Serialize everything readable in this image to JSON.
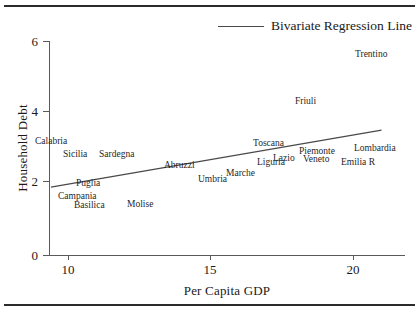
{
  "figure": {
    "background": "#ffffff",
    "text_color": "#1a1a1a",
    "rule_color": "#2b2b2b",
    "axis_color": "#5a5a5a",
    "line_color": "#4a4a4a"
  },
  "legend": {
    "label": "Bivariate Regression Line",
    "position": "top-right"
  },
  "axes": {
    "xlabel": "Per Capita GDP",
    "ylabel": "Household Debt",
    "xticks": [
      "10",
      "15",
      "20"
    ],
    "yticks": [
      "0",
      "2",
      "4",
      "6"
    ]
  },
  "chart_data": {
    "type": "scatter",
    "title": "",
    "subtitle": "",
    "xlabel": "Per Capita GDP",
    "ylabel": "Household Debt",
    "xlim": [
      9.3,
      21.7
    ],
    "ylim": [
      0,
      6.4
    ],
    "xticks": [
      10,
      15,
      20
    ],
    "yticks": [
      0,
      2,
      4,
      6
    ],
    "grid": false,
    "legend_position": "top-right",
    "point_style": "text-labels",
    "series": [
      {
        "name": "Italian Regions",
        "points": [
          {
            "label": "Trentino",
            "x": 20.6,
            "y": 5.7
          },
          {
            "label": "Friuli",
            "x": 17.3,
            "y": 4.4
          },
          {
            "label": "Calabria",
            "x": 9.6,
            "y": 3.2
          },
          {
            "label": "Sicilia",
            "x": 10.5,
            "y": 2.9
          },
          {
            "label": "Sardegna",
            "x": 12.1,
            "y": 2.9
          },
          {
            "label": "Toscana",
            "x": 17.3,
            "y": 3.1
          },
          {
            "label": "Lombardia",
            "x": 20.5,
            "y": 2.9
          },
          {
            "label": "Piemonte",
            "x": 18.7,
            "y": 2.8
          },
          {
            "label": "Lazio",
            "x": 17.9,
            "y": 2.7
          },
          {
            "label": "Veneto",
            "x": 18.9,
            "y": 2.7
          },
          {
            "label": "Emilia R",
            "x": 19.9,
            "y": 2.6
          },
          {
            "label": "Liguria",
            "x": 17.4,
            "y": 2.6
          },
          {
            "label": "Abruzzi",
            "x": 14.0,
            "y": 2.5
          },
          {
            "label": "Marche",
            "x": 15.8,
            "y": 2.4
          },
          {
            "label": "Umbria",
            "x": 15.1,
            "y": 2.3
          },
          {
            "label": "Puglia",
            "x": 10.9,
            "y": 2.0
          },
          {
            "label": "Campania",
            "x": 10.5,
            "y": 1.7
          },
          {
            "label": "Basilica",
            "x": 11.1,
            "y": 1.5
          },
          {
            "label": "Molise",
            "x": 13.0,
            "y": 1.5
          }
        ]
      }
    ],
    "regression_line": {
      "name": "Bivariate Regression Line",
      "x_start": 9.4,
      "y_start": 1.9,
      "x_end": 21.0,
      "y_end": 3.5
    }
  },
  "points": [
    {
      "label": "Trentino",
      "left": 355,
      "top": 49
    },
    {
      "label": "Friuli",
      "left": 295,
      "top": 96
    },
    {
      "label": "Calabria",
      "left": 35,
      "top": 136
    },
    {
      "label": "Sicilia",
      "left": 63,
      "top": 149
    },
    {
      "label": "Sardegna",
      "left": 99,
      "top": 149
    },
    {
      "label": "Toscana",
      "left": 253,
      "top": 138
    },
    {
      "label": "Lombardia",
      "left": 354,
      "top": 143
    },
    {
      "label": "Piemonte",
      "left": 299,
      "top": 146
    },
    {
      "label": "Lazio",
      "left": 273,
      "top": 153
    },
    {
      "label": "Veneto",
      "left": 303,
      "top": 154
    },
    {
      "label": "Emilia R",
      "left": 341,
      "top": 157
    },
    {
      "label": "Liguria",
      "left": 257,
      "top": 157
    },
    {
      "label": "Abruzzi",
      "left": 164,
      "top": 160
    },
    {
      "label": "Marche",
      "left": 226,
      "top": 168
    },
    {
      "label": "Umbria",
      "left": 198,
      "top": 174
    },
    {
      "label": "Puglia",
      "left": 76,
      "top": 178
    },
    {
      "label": "Campania",
      "left": 58,
      "top": 191
    },
    {
      "label": "Basilica",
      "left": 74,
      "top": 200
    },
    {
      "label": "Molise",
      "left": 127,
      "top": 199
    }
  ],
  "tick_positions": {
    "x": [
      {
        "label": "10",
        "left": 68
      },
      {
        "label": "15",
        "left": 210
      },
      {
        "label": "20",
        "left": 353
      }
    ],
    "y": [
      {
        "label": "0",
        "top": 255
      },
      {
        "label": "2",
        "top": 181
      },
      {
        "label": "4",
        "top": 111
      },
      {
        "label": "6",
        "top": 41
      }
    ]
  }
}
